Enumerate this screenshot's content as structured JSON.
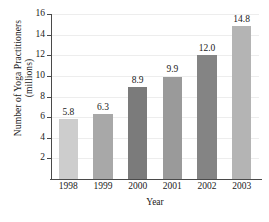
{
  "chart_data": {
    "type": "bar",
    "title": "",
    "xlabel": "Year",
    "ylabel": "Number of Yoga Practitioners (millions)",
    "ylabel_lines": [
      "Number of Yoga Practitioners",
      "(millions)"
    ],
    "categories": [
      "1998",
      "1999",
      "2000",
      "2001",
      "2002",
      "2003"
    ],
    "values": [
      5.8,
      6.3,
      8.9,
      9.9,
      12.0,
      14.8
    ],
    "value_labels": [
      "5.8",
      "6.3",
      "8.9",
      "9.9",
      "12.0",
      "14.8"
    ],
    "bar_colors": [
      "#cdcdcd",
      "#a8a8a8",
      "#7b7b7b",
      "#9a9a9a",
      "#848484",
      "#b4b4b4"
    ],
    "ylim": [
      0,
      16
    ],
    "yticks": [
      2,
      4,
      6,
      8,
      10,
      12,
      14,
      16
    ],
    "ytick_labels": [
      "2",
      "4",
      "6",
      "8",
      "10",
      "12",
      "14",
      "16"
    ],
    "grid": true,
    "legend": "none"
  }
}
